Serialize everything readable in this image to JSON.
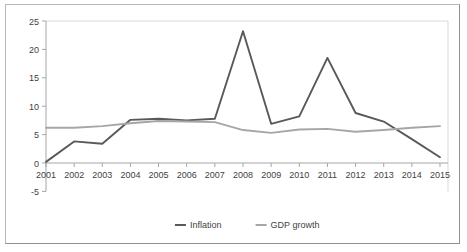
{
  "chart_data": {
    "type": "line",
    "title": "",
    "xlabel": "",
    "ylabel": "",
    "categories": [
      "2001",
      "2002",
      "2003",
      "2004",
      "2005",
      "2006",
      "2007",
      "2008",
      "2009",
      "2010",
      "2011",
      "2012",
      "2013",
      "2014",
      "2015"
    ],
    "x": [
      2001,
      2002,
      2003,
      2004,
      2005,
      2006,
      2007,
      2008,
      2009,
      2010,
      2011,
      2012,
      2013,
      2014,
      2015
    ],
    "series": [
      {
        "name": "Inflation",
        "color": "#595959",
        "values": [
          0.2,
          3.8,
          3.4,
          7.6,
          7.8,
          7.5,
          7.8,
          23.2,
          6.9,
          8.2,
          18.5,
          8.8,
          7.3,
          4.2,
          1.0
        ]
      },
      {
        "name": "GDP growth",
        "color": "#a6a6a6",
        "values": [
          6.2,
          6.2,
          6.5,
          7.0,
          7.4,
          7.3,
          7.2,
          5.8,
          5.3,
          5.9,
          6.0,
          5.5,
          5.8,
          6.2,
          6.5
        ]
      }
    ],
    "ylim": [
      -5,
      25
    ],
    "yticks": [
      -5,
      0,
      5,
      10,
      15,
      20,
      25
    ],
    "ytick_labels": [
      "-5",
      "0",
      "5",
      "10",
      "15",
      "20",
      "25"
    ],
    "grid": "horizontal-light",
    "legend": {
      "position": "bottom-center",
      "entries": [
        {
          "label": "Inflation",
          "color": "#595959"
        },
        {
          "label": "GDP growth",
          "color": "#a6a6a6"
        }
      ]
    }
  }
}
